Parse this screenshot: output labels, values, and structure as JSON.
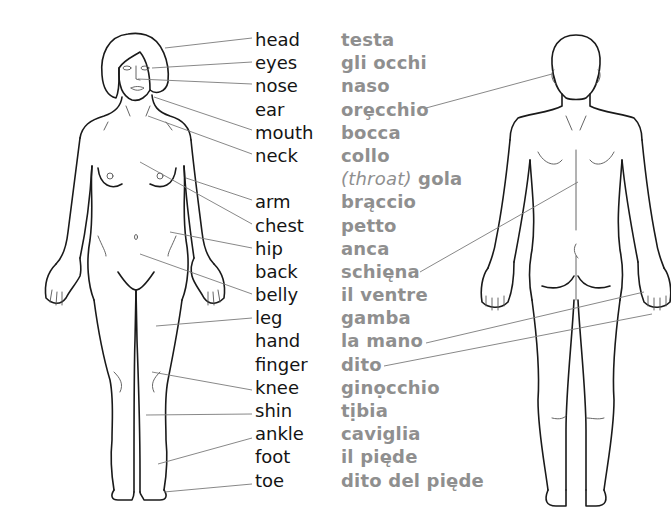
{
  "diagram": {
    "title": "",
    "colors": {
      "english_text": "#141414",
      "italian_text": "#8f8f8f",
      "leader_lines": "#7a7a7a",
      "figure_outline": "#1a1a1a",
      "background": "#ffffff"
    },
    "figures": [
      {
        "id": "front",
        "description": "front view of female body"
      },
      {
        "id": "back",
        "description": "back view of body"
      }
    ],
    "terms": [
      {
        "en": "head",
        "it": "testa",
        "points_to": "front"
      },
      {
        "en": "eyes",
        "it": "gli occhi",
        "points_to": "front"
      },
      {
        "en": "nose",
        "it": "naso",
        "points_to": "front"
      },
      {
        "en": "ear",
        "it": "orecchio",
        "it_display": "orȩcchio",
        "points_to": "back"
      },
      {
        "en": "mouth",
        "it": "bocca",
        "points_to": "front"
      },
      {
        "en": "neck",
        "it": "collo",
        "points_to": "front"
      },
      {
        "en": "",
        "it_note": "(throat)",
        "it": "gola",
        "points_to": ""
      },
      {
        "en": "arm",
        "it": "braccio",
        "it_display": "brąccio",
        "points_to": "front"
      },
      {
        "en": "chest",
        "it": "petto",
        "points_to": "front"
      },
      {
        "en": "hip",
        "it": "anca",
        "points_to": "front"
      },
      {
        "en": "back",
        "it": "schiena",
        "it_display": "schięna",
        "points_to": "back"
      },
      {
        "en": "belly",
        "it": "il ventre",
        "points_to": "front"
      },
      {
        "en": "leg",
        "it": "gamba",
        "points_to": "front"
      },
      {
        "en": "hand",
        "it": "la mano",
        "points_to": "back"
      },
      {
        "en": "finger",
        "it": "dito",
        "points_to": "back"
      },
      {
        "en": "knee",
        "it": "ginocchio",
        "it_display": "ginọcchio",
        "points_to": "front"
      },
      {
        "en": "shin",
        "it": "tibia",
        "it_display": "tịbia",
        "points_to": "front"
      },
      {
        "en": "ankle",
        "it": "caviglia",
        "points_to": "front"
      },
      {
        "en": "foot",
        "it": "il piede",
        "it_display": "il pięde",
        "points_to": ""
      },
      {
        "en": "toe",
        "it": "dito del piede",
        "it_display": "dito del pięde",
        "points_to": "front"
      }
    ]
  }
}
